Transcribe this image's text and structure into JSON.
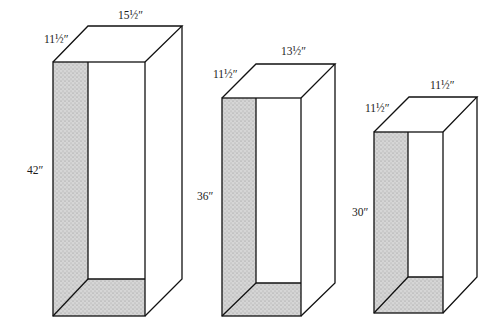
{
  "diagram": {
    "type": "isometric box dimensions",
    "colors": {
      "line": "#111111",
      "shade": "#cfcfcf",
      "background": "#ffffff"
    },
    "boxes": [
      {
        "id": "box-large",
        "height_label": "42″",
        "depth_label": "11½″",
        "width_label": "15½″",
        "geometry": {
          "fx1": 53,
          "fx2": 145,
          "fy1": 62,
          "fy2": 316,
          "dx": 36,
          "dy": 36
        }
      },
      {
        "id": "box-medium",
        "height_label": "36″",
        "depth_label": "11½″",
        "width_label": "13½″",
        "geometry": {
          "fx1": 222,
          "fx2": 301,
          "fy1": 98,
          "fy2": 316,
          "dx": 34,
          "dy": 34
        }
      },
      {
        "id": "box-small",
        "height_label": "30″",
        "depth_label": "11½″",
        "width_label": "11½″",
        "geometry": {
          "fx1": 374,
          "fx2": 443,
          "fy1": 132,
          "fy2": 313,
          "dx": 34,
          "dy": 35
        }
      }
    ]
  }
}
